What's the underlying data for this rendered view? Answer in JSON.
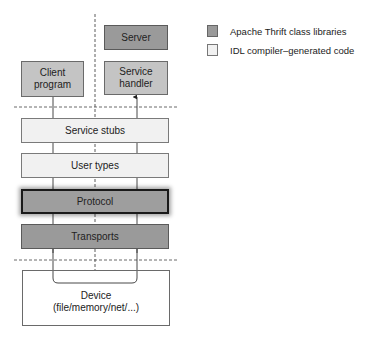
{
  "diagram": {
    "type": "Apache Thrift layered architecture",
    "top": {
      "server": {
        "label": "Server",
        "fill": "#9a9a9a",
        "category": "library"
      },
      "client_program": {
        "label": "Client\nprogram",
        "line1": "Client",
        "line2": "program",
        "fill": "#c4c4c4"
      },
      "service_handler": {
        "label": "Service\nhandler",
        "line1": "Service",
        "line2": "handler",
        "fill": "#c4c4c4"
      }
    },
    "layers": [
      {
        "label": "Service stubs",
        "fill": "#f1f1f1",
        "category": "generated"
      },
      {
        "label": "User types",
        "fill": "#f1f1f1",
        "category": "generated"
      },
      {
        "label": "Protocol",
        "fill": "#9e9e9e",
        "category": "library",
        "highlighted": true
      },
      {
        "label": "Transports",
        "fill": "#9a9a9a",
        "category": "library"
      }
    ],
    "device": {
      "line1": "Device",
      "line2": "(file/memory/net/...)"
    }
  },
  "legend": {
    "items": [
      {
        "label": "Apache Thrift class libraries",
        "color": "#9a9a9a"
      },
      {
        "label": "IDL compiler–generated code",
        "color": "#f1f1f1"
      }
    ]
  }
}
